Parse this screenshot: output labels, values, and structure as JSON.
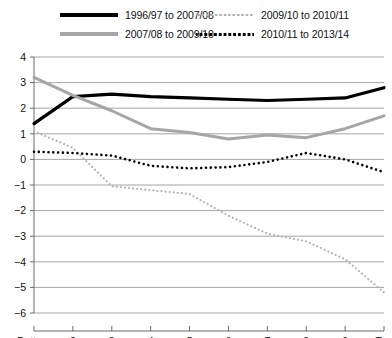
{
  "legend": {
    "items": [
      {
        "label": "1996/97 to 2007/08",
        "color": "#000000",
        "style": "solid",
        "width": 3.2,
        "icon": "legend-swatch-solid-black"
      },
      {
        "label": "2007/08 to 2009/10",
        "color": "#a6a6a6",
        "style": "solid",
        "width": 3.2,
        "icon": "legend-swatch-solid-gray"
      },
      {
        "label": "2009/10 to 2010/11",
        "color": "#b3b3b3",
        "style": "dotted",
        "width": 2.2,
        "icon": "legend-swatch-dotted-gray"
      },
      {
        "label": "2010/11 to 2013/14",
        "color": "#000000",
        "style": "dotted",
        "width": 2.6,
        "icon": "legend-swatch-dotted-black"
      }
    ]
  },
  "chart_data": {
    "type": "line",
    "title": "",
    "xlabel": "",
    "ylabel": "",
    "grid": true,
    "legend_position": "top",
    "categories": [
      "Bottom",
      "2",
      "3",
      "4",
      "5",
      "6",
      "7",
      "8",
      "9",
      "Top"
    ],
    "ylim": [
      -6,
      4
    ],
    "yticks": [
      4,
      3,
      2,
      1,
      0,
      -1,
      -2,
      -3,
      -4,
      -5,
      -6
    ],
    "ytick_labels": [
      "4",
      "3",
      "2",
      "1",
      "0",
      "−1",
      "−2",
      "−3",
      "−4",
      "−5",
      "−6"
    ],
    "series": [
      {
        "name": "1996/97 to 2007/08",
        "color": "#000000",
        "style": "solid",
        "width": 3.2,
        "values": [
          1.4,
          2.45,
          2.55,
          2.45,
          2.4,
          2.35,
          2.3,
          2.35,
          2.4,
          2.8
        ]
      },
      {
        "name": "2007/08 to 2009/10",
        "color": "#a6a6a6",
        "style": "solid",
        "width": 3.0,
        "values": [
          3.2,
          2.5,
          1.9,
          1.2,
          1.05,
          0.8,
          0.95,
          0.85,
          1.2,
          1.7
        ]
      },
      {
        "name": "2009/10 to 2010/11",
        "color": "#b3b3b3",
        "style": "dotted",
        "width": 2.2,
        "values": [
          1.1,
          0.45,
          -1.05,
          -1.2,
          -1.35,
          -2.2,
          -2.9,
          -3.2,
          -3.9,
          -5.2
        ]
      },
      {
        "name": "2010/11 to 2013/14",
        "color": "#000000",
        "style": "dotted",
        "width": 2.6,
        "values": [
          0.3,
          0.25,
          0.15,
          -0.25,
          -0.35,
          -0.3,
          -0.1,
          0.25,
          0.0,
          -0.5
        ]
      }
    ]
  }
}
